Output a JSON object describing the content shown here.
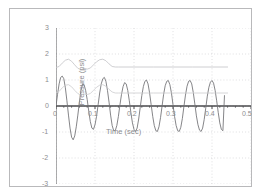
{
  "chart_data": {
    "type": "line",
    "title": "",
    "xlabel": "Time (sec)",
    "ylabel": "Pressure (psi)",
    "xlim": [
      0,
      0.5
    ],
    "ylim": [
      -3,
      3
    ],
    "xticks": [
      0,
      0.1,
      0.2,
      0.3,
      0.4,
      0.5
    ],
    "xtick_labels": [
      "0",
      "0.1",
      "0.2",
      "0.3",
      "0.4",
      "0.5"
    ],
    "yticks": [
      -3,
      -2,
      -1,
      0,
      1,
      2,
      3
    ],
    "ytick_labels": [
      "-3",
      "-2",
      "-1",
      "0",
      "1",
      "2",
      "3"
    ],
    "grid": true,
    "grid_style": "dotted",
    "legend": "none",
    "series": [
      {
        "name": "pressure-oscillation",
        "color": "#6f6f72",
        "comment": "Main oscillating pressure signal, ~25 Hz, beat/transient at start then steady amplitude ~1.0",
        "x": [
          0.0,
          0.004,
          0.008,
          0.012,
          0.016,
          0.02,
          0.024,
          0.028,
          0.032,
          0.036,
          0.04,
          0.044,
          0.048,
          0.052,
          0.056,
          0.06,
          0.064,
          0.068,
          0.072,
          0.076,
          0.08,
          0.084,
          0.088,
          0.092,
          0.096,
          0.1,
          0.104,
          0.108,
          0.112,
          0.116,
          0.12,
          0.124,
          0.128,
          0.132,
          0.136,
          0.14,
          0.144,
          0.148,
          0.152,
          0.156,
          0.16,
          0.164,
          0.168,
          0.172,
          0.176,
          0.18,
          0.184,
          0.188,
          0.192,
          0.196,
          0.2,
          0.204,
          0.208,
          0.212,
          0.216,
          0.22,
          0.224,
          0.228,
          0.232,
          0.236,
          0.24,
          0.244,
          0.248,
          0.252,
          0.256,
          0.26,
          0.264,
          0.268,
          0.272,
          0.276,
          0.28,
          0.284,
          0.288,
          0.292,
          0.296,
          0.3,
          0.304,
          0.308,
          0.312,
          0.316,
          0.32,
          0.324,
          0.328,
          0.332,
          0.336,
          0.34,
          0.344,
          0.348,
          0.352,
          0.356,
          0.36,
          0.364,
          0.368,
          0.372,
          0.376,
          0.38,
          0.384,
          0.388,
          0.392,
          0.396,
          0.4,
          0.404,
          0.408,
          0.412,
          0.416,
          0.42,
          0.424,
          0.428,
          0.432
        ],
        "y": [
          0.0,
          0.45,
          0.85,
          1.1,
          1.15,
          1.05,
          0.7,
          0.2,
          -0.35,
          -0.85,
          -1.2,
          -1.3,
          -1.15,
          -0.8,
          -0.35,
          0.15,
          0.6,
          0.85,
          0.82,
          0.6,
          0.25,
          -0.2,
          -0.6,
          -0.85,
          -0.9,
          -0.72,
          -0.4,
          0.05,
          0.5,
          0.85,
          1.05,
          1.1,
          0.95,
          0.6,
          0.15,
          -0.35,
          -0.75,
          -0.95,
          -0.95,
          -0.75,
          -0.4,
          0.05,
          0.45,
          0.75,
          0.9,
          0.85,
          0.6,
          0.2,
          -0.25,
          -0.65,
          -0.9,
          -0.98,
          -0.85,
          -0.5,
          -0.05,
          0.4,
          0.75,
          0.95,
          1.0,
          0.85,
          0.5,
          0.05,
          -0.4,
          -0.75,
          -0.95,
          -0.98,
          -0.8,
          -0.45,
          0.0,
          0.45,
          0.78,
          0.95,
          0.98,
          0.82,
          0.5,
          0.05,
          -0.4,
          -0.75,
          -0.95,
          -0.98,
          -0.82,
          -0.48,
          -0.02,
          0.42,
          0.76,
          0.95,
          0.98,
          0.85,
          0.52,
          0.08,
          -0.38,
          -0.72,
          -0.93,
          -0.98,
          -0.85,
          -0.52,
          -0.08,
          0.38,
          0.72,
          0.92,
          0.98,
          0.88,
          0.6,
          0.2,
          -0.25,
          -0.65,
          -0.9,
          -0.95,
          0.4
        ]
      },
      {
        "name": "upper-envelope-rms",
        "color": "#c2c2c5",
        "comment": "Smooth upper trace starting near 1.5, humps to ~1.8, settles flat at 1.5",
        "x": [
          0.0,
          0.008,
          0.016,
          0.024,
          0.032,
          0.04,
          0.048,
          0.056,
          0.064,
          0.072,
          0.08,
          0.088,
          0.096,
          0.104,
          0.112,
          0.12,
          0.128,
          0.136,
          0.144,
          0.152,
          0.16,
          0.2,
          0.25,
          0.3,
          0.35,
          0.4,
          0.44
        ],
        "y": [
          1.48,
          1.52,
          1.65,
          1.76,
          1.8,
          1.72,
          1.58,
          1.45,
          1.4,
          1.45,
          1.42,
          1.46,
          1.58,
          1.7,
          1.78,
          1.8,
          1.74,
          1.62,
          1.52,
          1.5,
          1.5,
          1.5,
          1.5,
          1.5,
          1.5,
          1.5,
          1.5
        ]
      },
      {
        "name": "lower-envelope-rms",
        "color": "#cbcbce",
        "comment": "Smooth lower trace starting near 0.5, humps to ~0.8, settles flat at 0.5",
        "x": [
          0.0,
          0.008,
          0.016,
          0.024,
          0.032,
          0.04,
          0.048,
          0.056,
          0.064,
          0.072,
          0.08,
          0.088,
          0.096,
          0.104,
          0.112,
          0.12,
          0.128,
          0.136,
          0.144,
          0.152,
          0.16,
          0.2,
          0.25,
          0.3,
          0.35,
          0.4,
          0.44
        ],
        "y": [
          0.5,
          0.56,
          0.7,
          0.8,
          0.82,
          0.74,
          0.6,
          0.48,
          0.42,
          0.46,
          0.44,
          0.48,
          0.6,
          0.72,
          0.8,
          0.82,
          0.76,
          0.64,
          0.54,
          0.5,
          0.5,
          0.5,
          0.5,
          0.5,
          0.5,
          0.5,
          0.5
        ]
      }
    ],
    "colors": {
      "axis": "#4a4a4d",
      "grid": "#c9c9cc",
      "tick_text": "#8d8d90",
      "frame": "#b9b9bb",
      "background": "#ffffff"
    }
  }
}
